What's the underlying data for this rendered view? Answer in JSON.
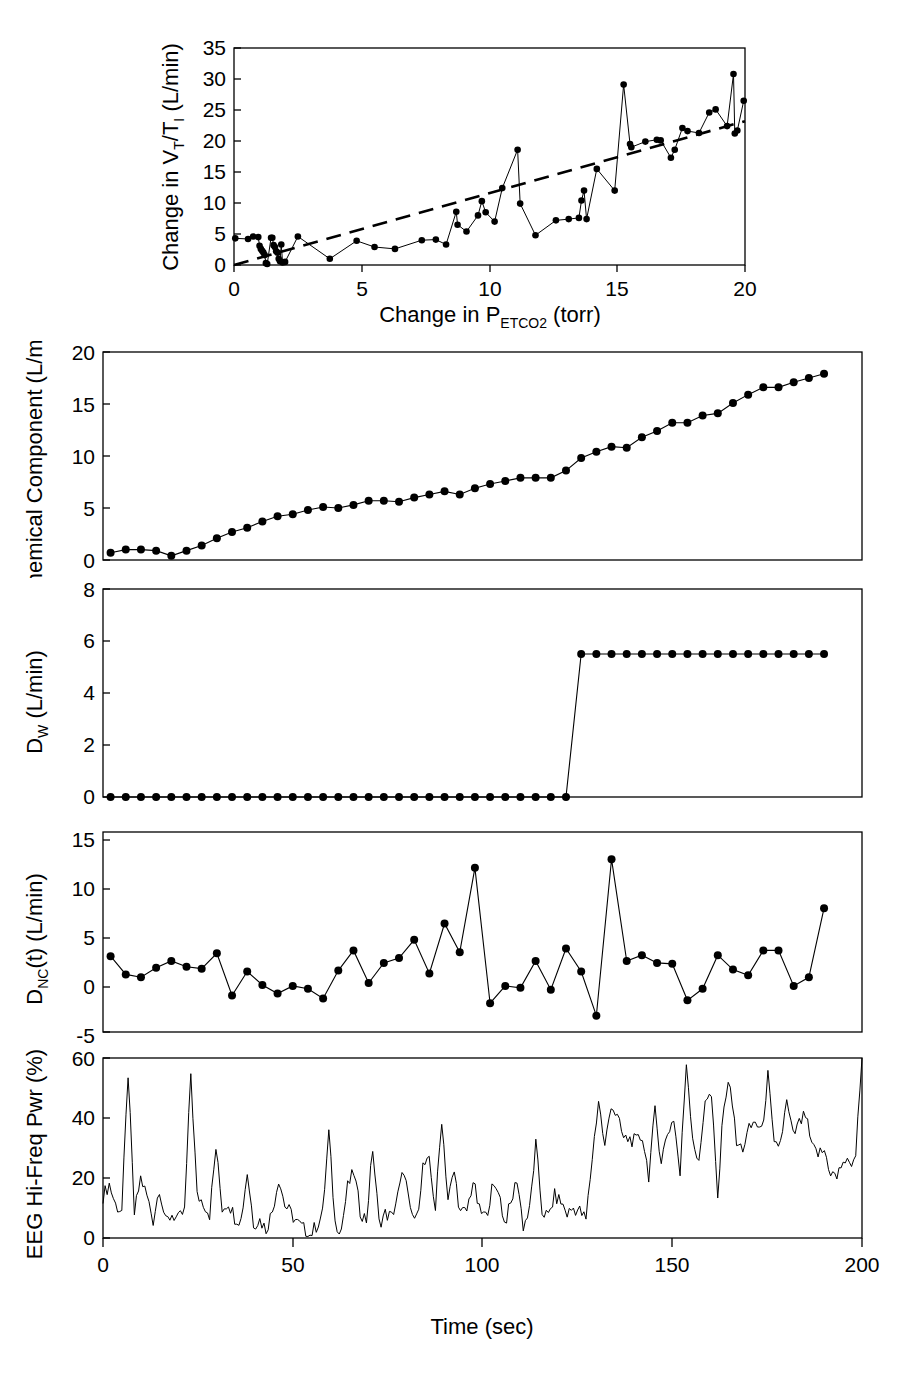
{
  "figure": {
    "title": "",
    "panel_count": 5
  },
  "chart_data": [
    {
      "id": "panel-a-vt-ti",
      "type": "scatter",
      "title": "",
      "xlabel": "Change in P",
      "xlabel_sub": "ETCO2",
      "xlabel_tail": " (torr)",
      "xlabel_full": "Change in P_ETCO2 (torr)",
      "ylabel": "Change in V",
      "ylabel_sub1": "T",
      "ylabel_mid": "/T",
      "ylabel_sub2": "I",
      "ylabel_tail": " (L/min)",
      "ylabel_full": "Change in V_T/T_I (L/min)",
      "xlim": [
        0,
        20
      ],
      "ylim": [
        0,
        35
      ],
      "xticks": [
        0,
        5,
        10,
        15,
        20
      ],
      "yticks": [
        0,
        5,
        10,
        15,
        20,
        25,
        30,
        35
      ],
      "grid": false,
      "legend": "none",
      "has_trendline": true,
      "trendline_style": "dashed",
      "trendline": {
        "x0": 0.0,
        "y0": 0.0,
        "x1": 20.0,
        "y1": 23.2
      },
      "points": [
        [
          0.05,
          4.3
        ],
        [
          0.55,
          4.2
        ],
        [
          0.75,
          4.6
        ],
        [
          0.95,
          4.5
        ],
        [
          1.0,
          3.1
        ],
        [
          1.05,
          2.6
        ],
        [
          1.1,
          2.3
        ],
        [
          1.15,
          2.0
        ],
        [
          1.2,
          1.6
        ],
        [
          1.25,
          0.3
        ],
        [
          1.3,
          0.15
        ],
        [
          1.45,
          4.4
        ],
        [
          1.5,
          4.4
        ],
        [
          1.55,
          3.2
        ],
        [
          1.6,
          2.9
        ],
        [
          1.65,
          2.2
        ],
        [
          1.7,
          2.0
        ],
        [
          1.75,
          1.0
        ],
        [
          1.8,
          0.6
        ],
        [
          1.85,
          3.3
        ],
        [
          1.9,
          0.4
        ],
        [
          2.0,
          0.5
        ],
        [
          2.5,
          4.6
        ],
        [
          3.75,
          1.0
        ],
        [
          4.8,
          3.9
        ],
        [
          5.5,
          2.9
        ],
        [
          6.3,
          2.6
        ],
        [
          7.35,
          4.0
        ],
        [
          7.9,
          4.1
        ],
        [
          8.3,
          3.3
        ],
        [
          8.7,
          8.6
        ],
        [
          8.75,
          6.5
        ],
        [
          9.1,
          5.4
        ],
        [
          9.55,
          8.0
        ],
        [
          9.7,
          10.3
        ],
        [
          9.85,
          8.5
        ],
        [
          10.2,
          7.0
        ],
        [
          10.5,
          12.4
        ],
        [
          11.1,
          18.6
        ],
        [
          11.2,
          9.9
        ],
        [
          11.8,
          4.8
        ],
        [
          12.6,
          7.2
        ],
        [
          13.1,
          7.4
        ],
        [
          13.5,
          7.6
        ],
        [
          13.6,
          10.4
        ],
        [
          13.7,
          12.0
        ],
        [
          13.8,
          7.4
        ],
        [
          14.2,
          15.5
        ],
        [
          14.9,
          12.0
        ],
        [
          15.25,
          29.1
        ],
        [
          15.5,
          19.5
        ],
        [
          15.55,
          19.0
        ],
        [
          16.1,
          19.9
        ],
        [
          16.55,
          20.2
        ],
        [
          16.7,
          20.1
        ],
        [
          17.1,
          17.3
        ],
        [
          17.25,
          18.6
        ],
        [
          17.55,
          22.1
        ],
        [
          17.75,
          21.6
        ],
        [
          18.2,
          21.3
        ],
        [
          18.6,
          24.6
        ],
        [
          18.85,
          25.1
        ],
        [
          19.3,
          22.4
        ],
        [
          19.55,
          30.8
        ],
        [
          19.6,
          21.2
        ],
        [
          19.7,
          21.7
        ],
        [
          19.95,
          26.5
        ]
      ]
    },
    {
      "id": "panel-b-chemical",
      "type": "line",
      "title": "",
      "xlabel": "",
      "ylabel": "Chemical Component (L/min)",
      "xlim": [
        0,
        200
      ],
      "ylim": [
        0,
        20
      ],
      "xticks": [
        0,
        50,
        100,
        150,
        200
      ],
      "yticks": [
        0,
        5,
        10,
        15,
        20
      ],
      "grid": false,
      "legend": "none",
      "markers": true,
      "x": [
        2,
        6,
        10,
        14,
        18,
        22,
        26,
        30,
        34,
        38,
        42,
        46,
        50,
        54,
        58,
        62,
        66,
        70,
        74,
        78,
        82,
        86,
        90,
        94,
        98,
        102,
        106,
        110,
        114,
        118,
        122,
        126,
        130,
        134,
        138,
        142,
        146,
        150,
        154,
        158,
        162,
        166,
        170,
        174,
        178,
        182,
        186,
        190
      ],
      "y": [
        0.7,
        1.0,
        1.0,
        0.9,
        0.4,
        0.9,
        1.4,
        2.1,
        2.7,
        3.1,
        3.7,
        4.2,
        4.4,
        4.8,
        5.1,
        5.0,
        5.3,
        5.7,
        5.7,
        5.6,
        6.0,
        6.3,
        6.6,
        6.3,
        6.9,
        7.3,
        7.6,
        7.9,
        7.9,
        7.9,
        8.6,
        9.8,
        10.4,
        10.9,
        10.8,
        11.8,
        12.4,
        13.2,
        13.2,
        13.9,
        14.1,
        15.1,
        15.9,
        16.6,
        16.6,
        17.1,
        17.5,
        17.9
      ]
    },
    {
      "id": "panel-c-dw",
      "type": "line",
      "title": "",
      "xlabel": "",
      "ylabel": "D",
      "ylabel_sub": "W",
      "ylabel_tail": " (L/min)",
      "ylabel_full": "D_W (L/min)",
      "xlim": [
        0,
        200
      ],
      "ylim": [
        0,
        8
      ],
      "xticks": [
        0,
        50,
        100,
        150,
        200
      ],
      "yticks": [
        0,
        2,
        4,
        6,
        8
      ],
      "grid": false,
      "legend": "none",
      "markers": true,
      "step_time": 123,
      "step_value": 5.5,
      "x": [
        2,
        6,
        10,
        14,
        18,
        22,
        26,
        30,
        34,
        38,
        42,
        46,
        50,
        54,
        58,
        62,
        66,
        70,
        74,
        78,
        82,
        86,
        90,
        94,
        98,
        102,
        106,
        110,
        114,
        118,
        122,
        126,
        130,
        134,
        138,
        142,
        146,
        150,
        154,
        158,
        162,
        166,
        170,
        174,
        178,
        182,
        186,
        190
      ],
      "y": [
        0,
        0,
        0,
        0,
        0,
        0,
        0,
        0,
        0,
        0,
        0,
        0,
        0,
        0,
        0,
        0,
        0,
        0,
        0,
        0,
        0,
        0,
        0,
        0,
        0,
        0,
        0,
        0,
        0,
        0,
        0,
        5.5,
        5.5,
        5.5,
        5.5,
        5.5,
        5.5,
        5.5,
        5.5,
        5.5,
        5.5,
        5.5,
        5.5,
        5.5,
        5.5,
        5.5,
        5.5,
        5.5
      ]
    },
    {
      "id": "panel-d-dnc",
      "type": "line",
      "title": "",
      "xlabel": "",
      "ylabel": "D",
      "ylabel_sub": "NC",
      "ylabel_tail": "(t) (L/min)",
      "ylabel_full": "D_NC(t) (L/min)",
      "xlim": [
        0,
        200
      ],
      "ylim": [
        -5,
        15
      ],
      "xticks": [
        0,
        50,
        100,
        150,
        200
      ],
      "yticks": [
        -5,
        0,
        5,
        10,
        15
      ],
      "grid": false,
      "legend": "none",
      "markers": true,
      "x": [
        2,
        6,
        10,
        14,
        18,
        22,
        26,
        30,
        34,
        38,
        42,
        46,
        50,
        54,
        58,
        62,
        66,
        70,
        74,
        78,
        82,
        86,
        90,
        94,
        98,
        102,
        106,
        110,
        114,
        118,
        122,
        126,
        130,
        134,
        138,
        142,
        146,
        150,
        154,
        158,
        162,
        166,
        170,
        174,
        178,
        182,
        186,
        190
      ],
      "y": [
        2.9,
        1.0,
        0.7,
        1.7,
        2.4,
        1.8,
        1.6,
        3.2,
        -1.2,
        1.3,
        -0.1,
        -1.0,
        -0.2,
        -0.5,
        -1.5,
        1.4,
        3.5,
        0.1,
        2.2,
        2.7,
        4.6,
        1.1,
        6.3,
        3.3,
        12.1,
        -2.0,
        -0.2,
        -0.4,
        2.4,
        -0.6,
        3.7,
        1.3,
        -3.3,
        13.0,
        2.4,
        3.0,
        2.2,
        2.1,
        -1.7,
        -0.5,
        3.0,
        1.5,
        0.9,
        3.5,
        3.5,
        -0.2,
        0.7,
        7.9,
        -1.9,
        -1.3,
        2.9
      ]
    },
    {
      "id": "panel-e-eeg",
      "type": "line",
      "title": "",
      "xlabel": "Time (sec)",
      "ylabel": "EEG Hi-Freq Pwr (%)",
      "xlim": [
        0,
        200
      ],
      "ylim": [
        0,
        60
      ],
      "xticks": [
        0,
        50,
        100,
        150,
        200
      ],
      "yticks": [
        0,
        20,
        40,
        60
      ],
      "grid": false,
      "legend": "none",
      "markers": false,
      "sampling_note": "dense trace, ~1 s resolution",
      "y": [
        14,
        18,
        11,
        9,
        55,
        8,
        20,
        14,
        6,
        17,
        5,
        8,
        6,
        9,
        55,
        14,
        12,
        8,
        30,
        10,
        12,
        7,
        6,
        22,
        5,
        6,
        3,
        9,
        20,
        11,
        8,
        5,
        3,
        1,
        4,
        8,
        35,
        5,
        3,
        17,
        22,
        9,
        6,
        30,
        5,
        8,
        7,
        14,
        23,
        8,
        6,
        24,
        25,
        10,
        40,
        13,
        22,
        8,
        9,
        19,
        9,
        7,
        16,
        17,
        5,
        11,
        20,
        4,
        9,
        31,
        9,
        7,
        14,
        12,
        8,
        10,
        9,
        6,
        27,
        46,
        30,
        45,
        40,
        33,
        33,
        32,
        34,
        21,
        42,
        26,
        35,
        40,
        21,
        59,
        34,
        24,
        47,
        47,
        13,
        46,
        52,
        31,
        30,
        36,
        39,
        35,
        54,
        30,
        32,
        45,
        34,
        38,
        41,
        30,
        28,
        29,
        22,
        20,
        26,
        24,
        28,
        60
      ]
    }
  ],
  "axis_shared": {
    "xlabel": "Time (sec)",
    "xticks": [
      "0",
      "50",
      "100",
      "150",
      "200"
    ]
  }
}
